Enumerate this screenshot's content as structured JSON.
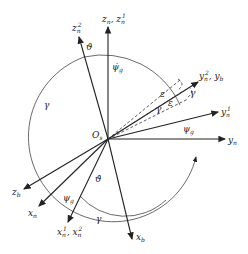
{
  "diagram": {
    "origin": {
      "label": "O",
      "sub": "s"
    },
    "axes": {
      "zn": {
        "label": "z",
        "sub": "n",
        "extra": ", z",
        "extra_sub": "n",
        "extra_sup": "1"
      },
      "zn2": {
        "label": "z",
        "sub": "n",
        "sup": "2"
      },
      "yn": {
        "label": "y",
        "sub": "n"
      },
      "yn1": {
        "label": "y",
        "sub": "n",
        "sup": "1"
      },
      "yn2yb": {
        "label": "y",
        "sub": "n",
        "sup": "2",
        "extra": ", y",
        "extra_sub": "b"
      },
      "zb": {
        "label": "z",
        "sub": "b"
      },
      "xn": {
        "label": "x",
        "sub": "n"
      },
      "xn1xn2": {
        "label": "x",
        "sub": "n",
        "sup": "1",
        "extra": ", x",
        "extra_sub": "n",
        "extra_sup": "2"
      },
      "xb": {
        "label": "x",
        "sub": "b"
      }
    },
    "angles": {
      "theta": "ϑ",
      "theta_dot": "ϑ̇",
      "psi_dot": "ψ̇",
      "psi_dot_sub": "g",
      "psi": "ψ",
      "psi_sub": "g",
      "gamma": "γ",
      "epsilon": "ε"
    }
  }
}
